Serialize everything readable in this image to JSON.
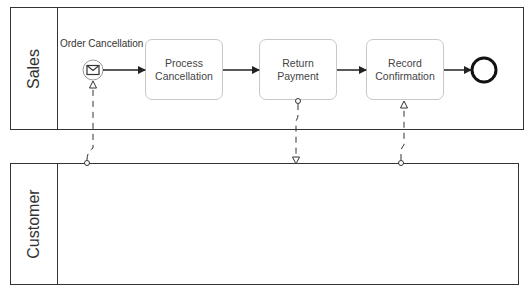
{
  "pools": [
    {
      "id": "sales",
      "label": "Sales"
    },
    {
      "id": "customer",
      "label": "Customer"
    }
  ],
  "events": {
    "start": {
      "label": "Order Cancellation",
      "type": "message-start",
      "icon": "envelope-icon"
    },
    "end": {
      "type": "end"
    }
  },
  "tasks": [
    {
      "label": "Process Cancellation"
    },
    {
      "label": "Return Payment"
    },
    {
      "label": "Record Confirmation"
    }
  ],
  "flows": {
    "sequence": [
      "Order Cancellation -> Process Cancellation",
      "Process Cancellation -> Return Payment",
      "Return Payment -> Record Confirmation",
      "Record Confirmation -> End"
    ],
    "message": [
      "Customer -> Order Cancellation",
      "Return Payment -> Customer",
      "Customer -> Record Confirmation"
    ]
  },
  "colors": {
    "stroke": "#333333",
    "task_border": "#c8c8c8",
    "background": "#ffffff"
  }
}
